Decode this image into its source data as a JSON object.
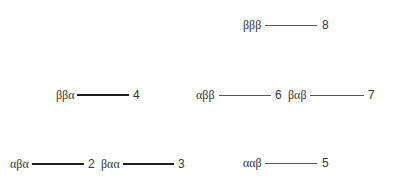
{
  "diagram": {
    "type": "energy-level-diagram",
    "levels": [
      {
        "id": 2,
        "state": "αβα",
        "number": "2",
        "weight": "heavy",
        "x_label": 10,
        "x_line_start": 32,
        "x_line_end": 84,
        "x_num": 88,
        "y": 157
      },
      {
        "id": 3,
        "state": "βαα",
        "number": "3",
        "weight": "heavy",
        "x_label": 101,
        "x_line_start": 123,
        "x_line_end": 174,
        "x_num": 178,
        "y": 157
      },
      {
        "id": 4,
        "state": "ββα",
        "number": "4",
        "weight": "heavy",
        "x_label": 56,
        "x_line_start": 77,
        "x_line_end": 129,
        "x_num": 133,
        "y": 88
      },
      {
        "id": 5,
        "state": "ααβ",
        "number": "5",
        "weight": "light",
        "x_label": 243,
        "x_line_start": 265,
        "x_line_end": 317,
        "x_num": 322,
        "y": 156
      },
      {
        "id": 6,
        "state": "αββ",
        "number": "6",
        "weight": "light",
        "x_label": 196,
        "x_line_start": 219,
        "x_line_end": 271,
        "x_num": 275,
        "y": 88
      },
      {
        "id": 7,
        "state": "βαβ",
        "number": "7",
        "weight": "light",
        "x_label": 288,
        "x_line_start": 310,
        "x_line_end": 364,
        "x_num": 368,
        "y": 88
      },
      {
        "id": 8,
        "state": "βββ",
        "number": "8",
        "weight": "light",
        "x_label": 243,
        "x_line_start": 265,
        "x_line_end": 317,
        "x_num": 322,
        "y": 18
      }
    ]
  }
}
